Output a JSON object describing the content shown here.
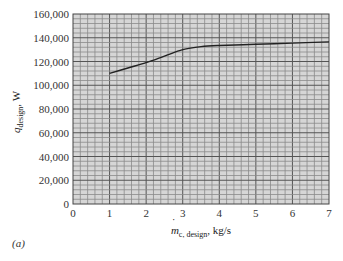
{
  "chart_data": {
    "type": "line",
    "title": "",
    "panel_label": "(a)",
    "xlabel": "ṁ_c, design, kg/s",
    "xlabel_parts": {
      "main": "m",
      "sub": "c, design",
      "unit": ", kg/s"
    },
    "ylabel": "q_design, W",
    "ylabel_parts": {
      "main": "q",
      "sub": "design",
      "unit": ", W"
    },
    "xlim": [
      0,
      7
    ],
    "ylim": [
      0,
      160000
    ],
    "x_ticks": [
      "0",
      "1",
      "2",
      "3",
      "4",
      "5",
      "6",
      "7"
    ],
    "y_ticks": [
      "0",
      "20,000",
      "40,000",
      "60,000",
      "80,000",
      "100,000",
      "120,000",
      "140,000",
      "160,000"
    ],
    "grid": true,
    "grid_minor_x_per_unit": 5,
    "grid_minor_y_per_major": 5,
    "series": [
      {
        "name": "q_design",
        "x": [
          1.0,
          1.5,
          2.0,
          2.5,
          3.0,
          3.5,
          4.0,
          5.0,
          6.0,
          7.0
        ],
        "y": [
          110000,
          114500,
          119000,
          124500,
          130000,
          132500,
          133500,
          134500,
          135500,
          136500
        ]
      }
    ],
    "colors": {
      "background": "#d6d6d6",
      "grid_minor": "#8a8a8a",
      "grid_major": "#555555",
      "line": "#222222"
    }
  }
}
